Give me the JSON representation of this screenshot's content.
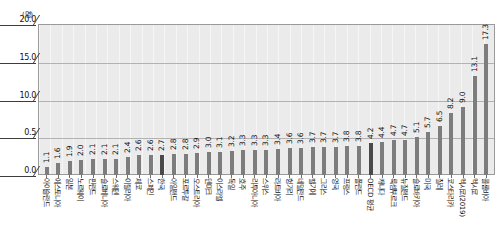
{
  "chart_data": {
    "type": "bar",
    "title": "",
    "subtitle": "",
    "xlabel": "",
    "ylabel": "",
    "unit_label": "(명)",
    "ylim": [
      0.0,
      20.0
    ],
    "ytick_labels": [
      "20.0",
      "15.0",
      "10.0",
      "0.5",
      "0.0"
    ],
    "ytick_values": [
      20.0,
      15.0,
      10.0,
      5.0,
      0.0
    ],
    "grid": true,
    "legend": "none",
    "orientation": "vertical",
    "categories": [
      "아이슬란드",
      "에스토니아",
      "일본",
      "노르웨이",
      "핀란드",
      "슬로베니아",
      "스웨덴",
      "이탈리아",
      "체코",
      "스페인",
      "한국",
      "아일랜드",
      "포르투갈",
      "오스트리아",
      "덴마크",
      "이스라엘",
      "독일",
      "호주",
      "리투아니아",
      "스위스",
      "라트비아",
      "헝가리",
      "네덜란드",
      "벨기에",
      "그리스",
      "영국",
      "프랑스",
      "폴란드",
      "OECD 평균",
      "캐나다",
      "룩셈부르크",
      "뉴질랜드",
      "슬로바키아",
      "미국",
      "칠레",
      "코스타리카",
      "멕시코(2019)",
      "멕시코",
      "콜롬비아"
    ],
    "values": [
      1.1,
      1.6,
      1.9,
      2.0,
      2.1,
      2.1,
      2.1,
      2.4,
      2.6,
      2.6,
      2.7,
      2.8,
      2.8,
      2.9,
      3.0,
      3.1,
      3.2,
      3.3,
      3.3,
      3.3,
      3.4,
      3.6,
      3.6,
      3.7,
      3.7,
      3.7,
      3.8,
      3.8,
      4.2,
      4.4,
      4.7,
      4.7,
      5.1,
      5.7,
      6.5,
      8.2,
      9.0,
      13.1,
      17.3
    ],
    "value_labels": [
      "1.1",
      "1.6",
      "1.9",
      "2.0",
      "2.1",
      "2.1",
      "2.1",
      "2.4",
      "2.6",
      "2.6",
      "2.7",
      "2.8",
      "2.8",
      "2.9",
      "3.0",
      "3.1",
      "3.2",
      "3.3",
      "3.3",
      "3.3",
      "3.4",
      "3.6",
      "3.6",
      "3.7",
      "3.7",
      "3.7",
      "3.8",
      "3.8",
      "4.2",
      "4.4",
      "4.7",
      "4.7",
      "5.1",
      "5.7",
      "6.5",
      "8.2",
      "9.0",
      "13.1",
      "17.3"
    ],
    "highlighted_categories": [
      "한국",
      "OECD 평균"
    ],
    "colors": {
      "bar": "#7d7d7d",
      "bar_highlight": "#4a4a4a",
      "plot_background": "#ebebeb",
      "gridline": "#b2b2b2",
      "axis": "#3d3d3d",
      "text": "#111111"
    }
  }
}
